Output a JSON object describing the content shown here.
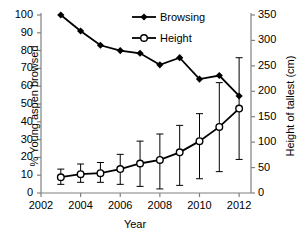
{
  "chart_data": {
    "type": "line",
    "title": "",
    "xlabel": "Year",
    "ylabel": "% Young aspen browsed",
    "ylabel_right": "Height of tallest (cm)",
    "x": [
      2003,
      2004,
      2005,
      2006,
      2007,
      2008,
      2009,
      2010,
      2011,
      2012
    ],
    "xlim": [
      2002,
      2012.6
    ],
    "xticks": [
      2002,
      2004,
      2006,
      2008,
      2010,
      2012
    ],
    "xticklabels": [
      "2002",
      "2004",
      "2006",
      "2008",
      "2010",
      "2012"
    ],
    "ylim": [
      0,
      100
    ],
    "yticks": [
      0,
      10,
      20,
      30,
      40,
      50,
      60,
      70,
      80,
      90,
      100
    ],
    "yticklabels": [
      "0",
      "10",
      "20",
      "30",
      "40",
      "50",
      "60",
      "70",
      "80",
      "90",
      "100"
    ],
    "ylim_right": [
      0,
      350
    ],
    "yticks_right": [
      0,
      50,
      100,
      150,
      200,
      250,
      300,
      350
    ],
    "yticklabels_right": [
      "0",
      "50",
      "100",
      "150",
      "200",
      "250",
      "300",
      "350"
    ],
    "grid": false,
    "legend_position": "top-center",
    "series": [
      {
        "name": "Browsing",
        "axis": "left",
        "marker": "filled-diamond",
        "color": "#000000",
        "values": [
          100,
          91,
          83,
          80,
          78.5,
          72,
          76,
          64,
          66,
          54.5
        ]
      },
      {
        "name": "Height",
        "axis": "right",
        "marker": "open-circle",
        "color": "#000000",
        "values": [
          31,
          37,
          39,
          47,
          58,
          65,
          80,
          102,
          130,
          166
        ],
        "error_low": [
          17,
          21,
          21,
          17,
          13,
          8,
          15,
          28,
          42,
          66
        ],
        "error_high": [
          47,
          57,
          60,
          76,
          102,
          116,
          133,
          156,
          217,
          266
        ]
      }
    ]
  },
  "legend": {
    "items": [
      {
        "label": "Browsing"
      },
      {
        "label": "Height"
      }
    ]
  }
}
